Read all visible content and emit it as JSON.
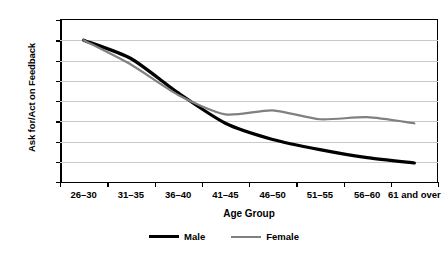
{
  "chart_data": {
    "type": "line",
    "title": "",
    "xlabel": "Age Group",
    "ylabel": "Ask for/Act on Feedback",
    "categories": [
      "26–30",
      "31–35",
      "36–40",
      "41–45",
      "46–50",
      "51–55",
      "56–60",
      "61 and over"
    ],
    "ylim": [
      35.0,
      75.0
    ],
    "ytick_labels": [
      "75.0",
      "70.0",
      "65.0",
      "60.0",
      "55.0",
      "50.0",
      "45.0",
      "40.0",
      "35.0"
    ],
    "ytick_values": [
      75.0,
      70.0,
      65.0,
      60.0,
      55.0,
      50.0,
      45.0,
      40.0,
      35.0
    ],
    "grid": true,
    "legend_position": "bottom",
    "series": [
      {
        "name": "Male",
        "color": "#000000",
        "width": 3.2,
        "values": [
          70.0,
          65.5,
          57.0,
          49.5,
          45.5,
          43.0,
          41.0,
          39.7
        ]
      },
      {
        "name": "Female",
        "color": "#808080",
        "width": 2.2,
        "values": [
          70.0,
          64.0,
          56.5,
          51.7,
          52.7,
          50.5,
          51.0,
          49.5
        ]
      }
    ]
  },
  "legend": {
    "items": [
      {
        "label": "Male",
        "swatch": "male-line-swatch"
      },
      {
        "label": "Female",
        "swatch": "female-line-swatch"
      }
    ]
  }
}
